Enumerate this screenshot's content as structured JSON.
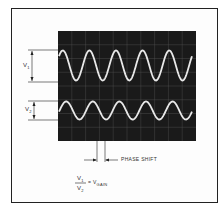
{
  "diagram": {
    "type": "oscilloscope-phase-shift",
    "labels": {
      "v1": "V",
      "v1_sub": "1",
      "v2": "V",
      "v2_sub": "2",
      "phase_shift": "PHASE SHIFT",
      "formula_num": "V",
      "formula_num_sub": "1",
      "formula_den": "V",
      "formula_den_sub": "2",
      "formula_eq": "= V",
      "formula_result_sub": "GAIN"
    },
    "signals": [
      {
        "name": "V1",
        "cycles": 5,
        "relative_amplitude": 1.0
      },
      {
        "name": "V2",
        "cycles": 5,
        "relative_amplitude": 0.6
      }
    ],
    "colors": {
      "screen": "#1a1a1a",
      "grid": "#555555",
      "trace": "#e8e8e8",
      "line": "#222222"
    }
  }
}
